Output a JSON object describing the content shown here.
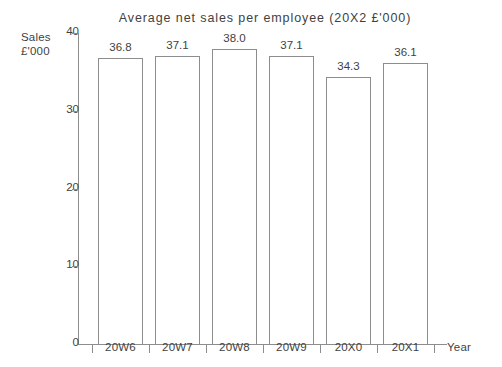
{
  "chart_data": {
    "type": "bar",
    "title": "Average net sales per employee (20X2 £'000)",
    "categories": [
      "20W6",
      "20W7",
      "20W8",
      "20W9",
      "20X0",
      "20X1"
    ],
    "values": [
      36.8,
      37.1,
      38.0,
      37.1,
      34.3,
      36.1
    ],
    "value_labels": [
      "36.8",
      "37.1",
      "38.0",
      "37.1",
      "34.3",
      "36.1"
    ],
    "xlabel": "Year",
    "ylabel": "Sales £'000",
    "ylabel_line1": "Sales",
    "ylabel_line2": "£'000",
    "ylim": [
      0,
      40
    ],
    "yticks": [
      0,
      10,
      20,
      30,
      40
    ],
    "ytick_labels": [
      "0",
      "10",
      "20",
      "30",
      "40"
    ],
    "grid": false,
    "legend": false,
    "bar_fill_color": "#ffffff",
    "bar_edge_color": "#8d8d8d",
    "axis_color": "#8d8d8d",
    "text_color": "#3f3f3f",
    "background_color": "#ffffff"
  }
}
